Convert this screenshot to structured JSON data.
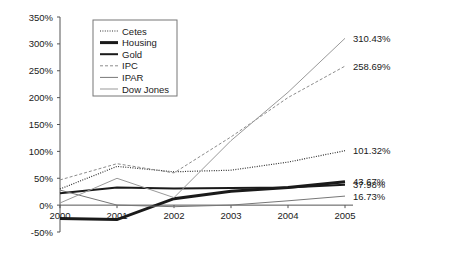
{
  "chart_data": {
    "type": "line",
    "title": "",
    "xlabel": "",
    "ylabel": "",
    "x": [
      "2000",
      "2001",
      "2002",
      "2003",
      "2004",
      "2005"
    ],
    "categories": [
      "2000",
      "2001",
      "2002",
      "2003",
      "2004",
      "2005"
    ],
    "ylim": [
      -50,
      350
    ],
    "ytick_values": [
      350,
      300,
      250,
      200,
      150,
      100,
      50,
      0,
      -50
    ],
    "ytick_labels": [
      "350%",
      "300%",
      "250%",
      "200%",
      "150%",
      "100%",
      "50%",
      "0%",
      "-50%"
    ],
    "grid": false,
    "legend_position": "top-left-inside",
    "series": [
      {
        "name": "Cetes",
        "style": "dotted",
        "color": "#333333",
        "width": 1.2,
        "values": [
          30,
          72,
          62,
          65,
          80,
          101.32
        ],
        "end_label": "101.32%"
      },
      {
        "name": "Housing",
        "style": "solid-thick",
        "color": "#1a1a1a",
        "width": 3.0,
        "values": [
          -25,
          -27,
          12,
          26,
          33,
          43.67
        ],
        "end_label": "43.67%"
      },
      {
        "name": "Gold",
        "style": "solid-medium",
        "color": "#1a1a1a",
        "width": 2.0,
        "values": [
          22,
          33,
          31,
          32,
          33,
          37.98
        ],
        "end_label": "37.98%"
      },
      {
        "name": "IPC",
        "style": "dashed",
        "color": "#8c8c8c",
        "width": 1.0,
        "values": [
          47,
          77,
          60,
          127,
          200,
          258.69
        ],
        "end_label": "258.69%"
      },
      {
        "name": "IPAR",
        "style": "solid-thin",
        "color": "#777777",
        "width": 1.0,
        "values": [
          28,
          0,
          -3,
          0,
          8,
          16.73
        ],
        "end_label": "16.73%"
      },
      {
        "name": "Dow Jones",
        "style": "solid-thin-light",
        "color": "#999999",
        "width": 1.0,
        "values": [
          4,
          50,
          14,
          120,
          210,
          310.43
        ],
        "end_label": "310.43%"
      }
    ],
    "legend": [
      "Cetes",
      "Housing",
      "Gold",
      "IPC",
      "IPAR",
      "Dow Jones"
    ],
    "annotations": [
      {
        "text": "310.43%",
        "series": "Dow Jones"
      },
      {
        "text": "258.69%",
        "series": "IPC"
      },
      {
        "text": "101.32%",
        "series": "Cetes"
      },
      {
        "text": "43.67%",
        "series": "Housing"
      },
      {
        "text": "37.98%",
        "series": "Gold"
      },
      {
        "text": "16.73%",
        "series": "IPAR"
      }
    ]
  }
}
